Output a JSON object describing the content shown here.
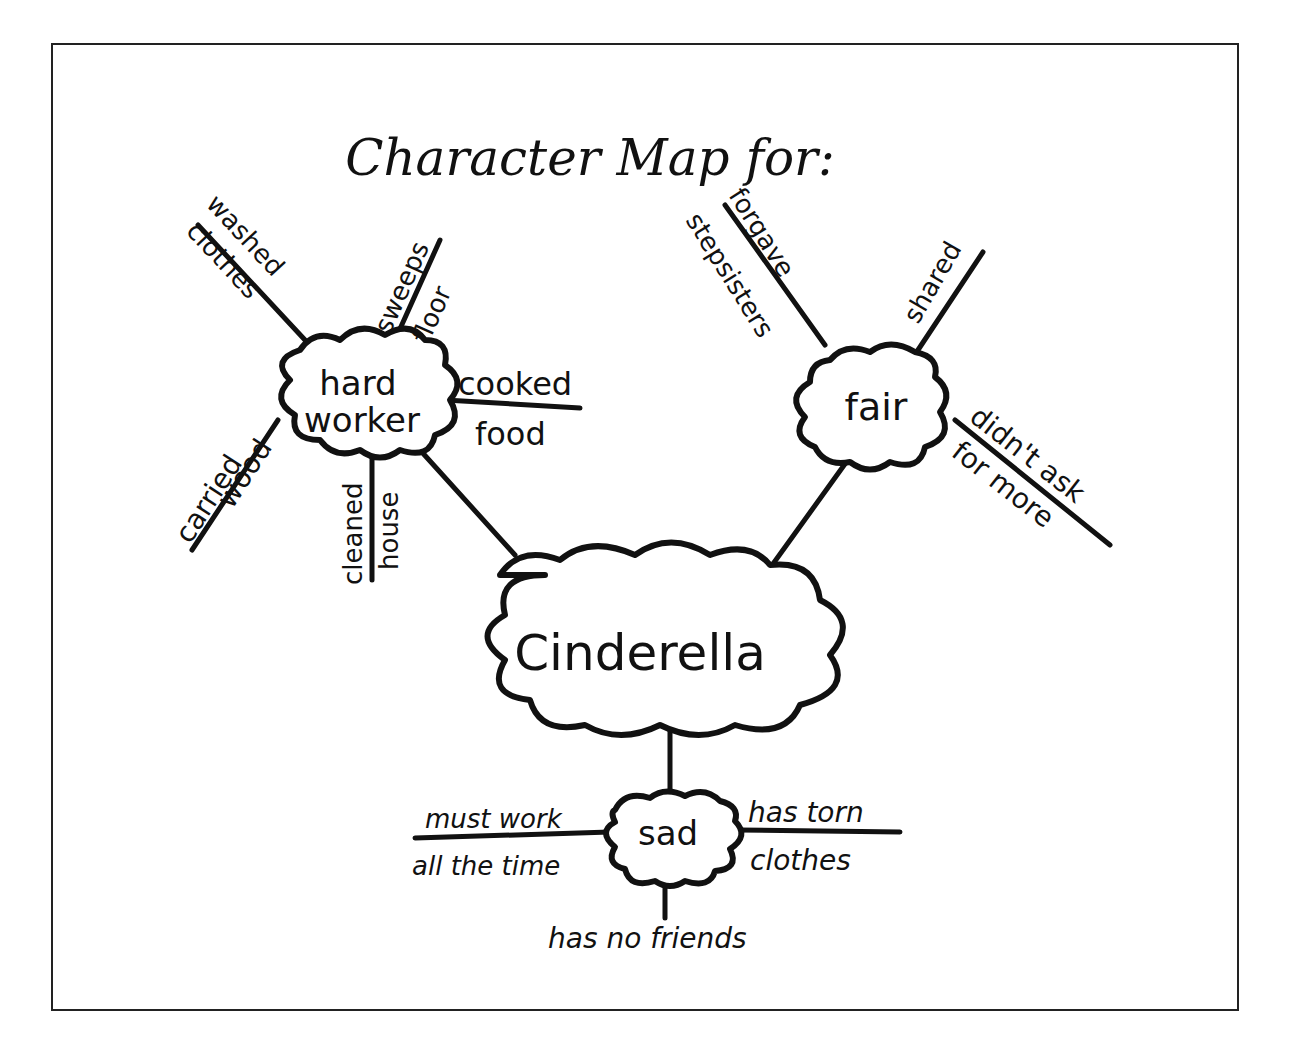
{
  "title": "Character Map for:",
  "center": {
    "label": "Cinderella"
  },
  "traits": [
    {
      "label_line1": "hard",
      "label_line2": "worker",
      "details": [
        {
          "top": "washed",
          "bottom": "clothes"
        },
        {
          "top": "sweeps",
          "bottom": "floor"
        },
        {
          "top": "cooked",
          "bottom": "food"
        },
        {
          "top": "carried",
          "bottom": "wood"
        },
        {
          "top": "cleaned",
          "bottom": "house"
        }
      ]
    },
    {
      "label": "fair",
      "details": [
        {
          "top": "forgave",
          "bottom": "stepsisters"
        },
        {
          "top": "shared",
          "bottom": ""
        },
        {
          "top": "didn't ask",
          "bottom": "for more"
        }
      ]
    },
    {
      "label": "sad",
      "details": [
        {
          "top": "must work",
          "bottom": "all the time"
        },
        {
          "top": "has torn",
          "bottom": "clothes"
        },
        {
          "top": "",
          "bottom": "has no friends"
        }
      ]
    }
  ],
  "colors": {
    "ink": "#111111",
    "background": "#ffffff",
    "border": "#222222"
  }
}
